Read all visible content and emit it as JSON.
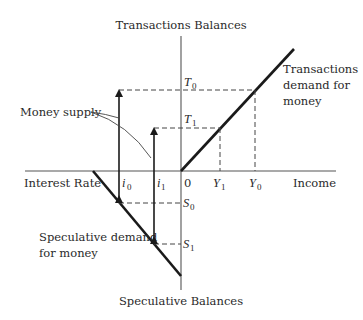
{
  "diagram": {
    "axes": {
      "top": "Transactions Balances",
      "bottom": "Speculative Balances",
      "left": "Interest Rate",
      "right": "Income",
      "origin": "0"
    },
    "curves": {
      "transactions_demand": [
        "Transactions",
        "demand for",
        "money"
      ],
      "speculative_demand": [
        "Speculative demand",
        "for money"
      ]
    },
    "annotations": {
      "money_supply": "Money supply"
    },
    "levels": {
      "T0": {
        "base": "T",
        "sub": "0"
      },
      "T1": {
        "base": "T",
        "sub": "1"
      },
      "Y0": {
        "base": "Y",
        "sub": "0"
      },
      "Y1": {
        "base": "Y",
        "sub": "1"
      },
      "S0": {
        "base": "S",
        "sub": "0"
      },
      "S1": {
        "base": "S",
        "sub": "1"
      },
      "i0": {
        "base": "i",
        "sub": "0"
      },
      "i1": {
        "base": "i",
        "sub": "1"
      }
    }
  }
}
